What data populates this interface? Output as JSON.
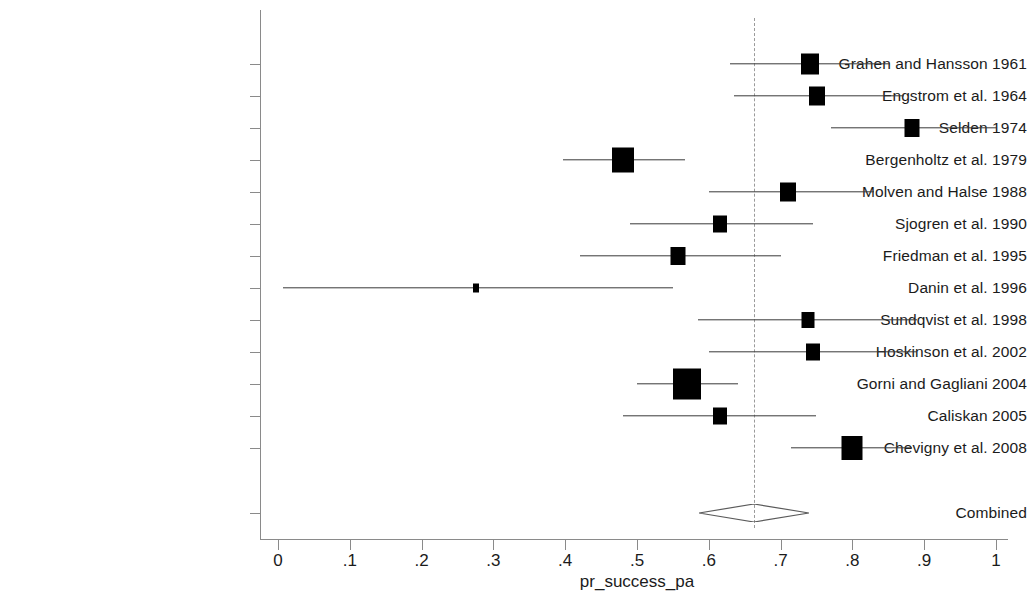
{
  "chart_data": {
    "type": "forest",
    "title": "",
    "xlabel": "pr_success_pa",
    "ylabel": "",
    "xlim": [
      0,
      1
    ],
    "xticks": [
      0,
      0.1,
      0.2,
      0.3,
      0.4,
      0.5,
      0.6,
      0.7,
      0.8,
      0.9,
      1
    ],
    "xticklabels": [
      "0",
      ".1",
      ".2",
      ".3",
      ".4",
      ".5",
      ".6",
      ".7",
      ".8",
      ".9",
      "1"
    ],
    "grid": false,
    "legend": "none",
    "null_line_value": 0.663,
    "marker_color": "#000000",
    "ci_color": "#3a3a3a",
    "null_line_color": "#9a9a9a",
    "categories": [
      "Grahen and Hansson 1961",
      "Engstrom et al. 1964",
      "Selden 1974",
      "Bergenholtz et al. 1979",
      "Molven and Halse 1988",
      "Sjogren et al. 1990",
      "Friedman et al. 1995",
      "Danin et al. 1996",
      "Sundqvist et al. 1998",
      "Hoskinson et al. 2002",
      "Gorni and Gagliani 2004",
      "Caliskan 2005",
      "Chevigny et al. 2008"
    ],
    "values": [
      0.741,
      0.751,
      0.883,
      0.481,
      0.711,
      0.616,
      0.557,
      0.276,
      0.738,
      0.745,
      0.57,
      0.616,
      0.8
    ],
    "ci_low": [
      0.63,
      0.635,
      0.77,
      0.397,
      0.6,
      0.49,
      0.42,
      0.007,
      0.585,
      0.6,
      0.5,
      0.48,
      0.715
    ],
    "ci_high": [
      0.852,
      0.872,
      1.0,
      0.567,
      0.83,
      0.745,
      0.7,
      0.55,
      0.89,
      0.89,
      0.64,
      0.75,
      0.883
    ],
    "marker_sizes": [
      18,
      16,
      15,
      22,
      16,
      14,
      15,
      6,
      13,
      14,
      28,
      14,
      21
    ],
    "combined": {
      "label": "Combined",
      "value": 0.663,
      "ci_low": 0.585,
      "ci_high": 0.738
    }
  }
}
